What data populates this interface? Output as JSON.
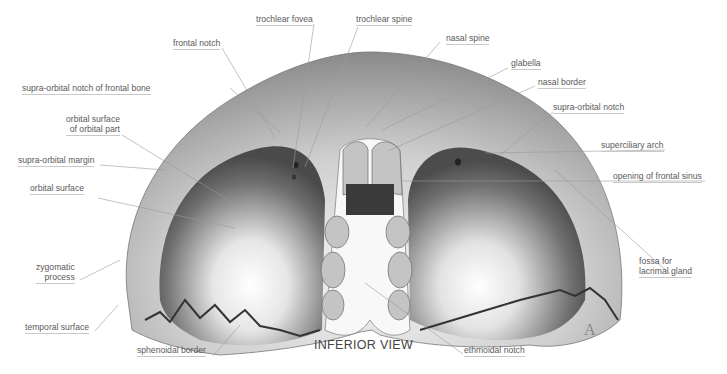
{
  "figure": {
    "view_title": "INFERIOR VIEW",
    "panel_letter": "A"
  },
  "labels": [
    {
      "id": "trochlear-fovea",
      "text": "trochlear fovea"
    },
    {
      "id": "trochlear-spine",
      "text": "trochlear spine"
    },
    {
      "id": "frontal-notch",
      "text": "frontal notch"
    },
    {
      "id": "nasal-spine",
      "text": "nasal spine"
    },
    {
      "id": "glabella",
      "text": "glabella"
    },
    {
      "id": "supra-orbital-notch-of-frontal-bone",
      "text": "supra-orbital notch of frontal bone"
    },
    {
      "id": "nasal-border",
      "text": "nasal border"
    },
    {
      "id": "supra-orbital-notch",
      "text": "supra-orbital notch"
    },
    {
      "id": "orbital-surface-of-orbital-part",
      "text": "orbital surface\nof orbital part",
      "line1": "orbital surface",
      "line2": "of orbital part"
    },
    {
      "id": "supra-orbital-margin",
      "text": "supra-orbital margin"
    },
    {
      "id": "superciliary-arch",
      "text": "superciliary arch"
    },
    {
      "id": "orbital-surface",
      "text": "orbital surface"
    },
    {
      "id": "opening-of-frontal-sinus",
      "text": "opening of frontal sinus"
    },
    {
      "id": "zygomatic-process",
      "text": "zygomatic\nprocess",
      "line1": "zygomatic",
      "line2": "process"
    },
    {
      "id": "fossa-for-lacrimal-gland",
      "text": "fossa for\nlacrimal gland",
      "line1": "fossa for",
      "line2": "lacrimal gland"
    },
    {
      "id": "temporal-surface",
      "text": "temporal surface"
    },
    {
      "id": "sphenoidal-border",
      "text": "sphenoidal border"
    },
    {
      "id": "ethmoidal-notch",
      "text": "ethmoidal notch"
    }
  ]
}
